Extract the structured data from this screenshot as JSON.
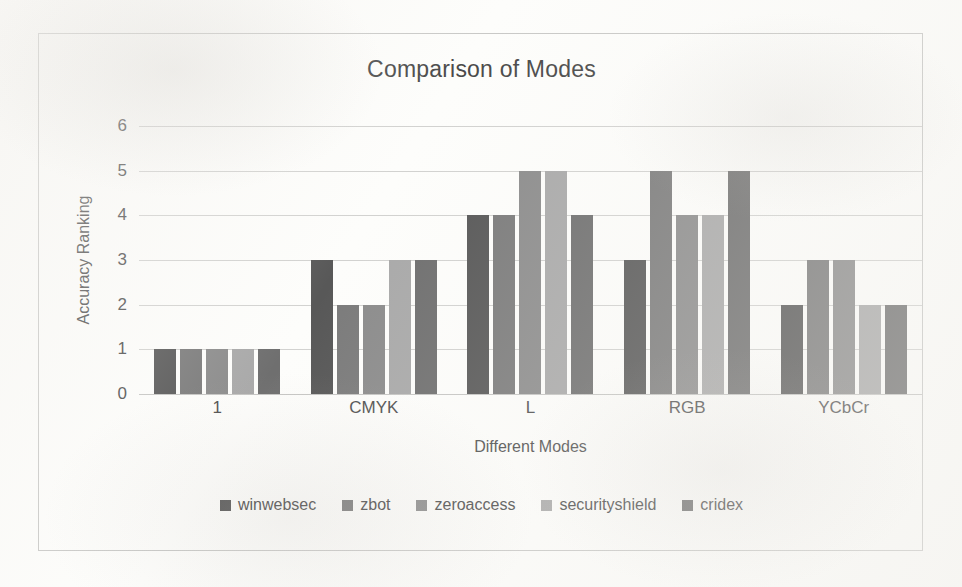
{
  "chart_data": {
    "type": "bar",
    "title": "Comparison of Modes",
    "xlabel": "Different Modes",
    "ylabel": "Accuracy Ranking",
    "categories": [
      "1",
      "CMYK",
      "L",
      "RGB",
      "YCbCr"
    ],
    "yticks": [
      "0",
      "1",
      "2",
      "3",
      "4",
      "5",
      "6"
    ],
    "ylim": [
      0,
      6
    ],
    "grid": true,
    "legend_position": "bottom",
    "series": [
      {
        "name": "winwebsec",
        "color": "#585858",
        "values": [
          1,
          3,
          4,
          3,
          2
        ]
      },
      {
        "name": "zbot",
        "color": "#7b7b7b",
        "values": [
          1,
          2,
          4,
          5,
          3
        ]
      },
      {
        "name": "zeroaccess",
        "color": "#8c8c8c",
        "values": [
          1,
          2,
          5,
          4,
          3
        ]
      },
      {
        "name": "securityshield",
        "color": "#a9a9a9",
        "values": [
          1,
          3,
          5,
          4,
          2
        ]
      },
      {
        "name": "cridex",
        "color": "#6f6f6f",
        "values": [
          1,
          3,
          4,
          5,
          2
        ]
      }
    ]
  }
}
